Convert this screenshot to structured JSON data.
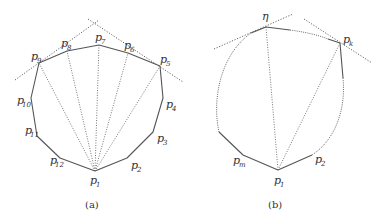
{
  "figure": {
    "panels": [
      {
        "id": "a",
        "caption": "(a)",
        "vertices": [
          {
            "name": "p",
            "sub": "1",
            "x": 95,
            "y": 171,
            "lx": 90,
            "ly": 184
          },
          {
            "name": "p",
            "sub": "2",
            "x": 127,
            "y": 158,
            "lx": 131,
            "ly": 169
          },
          {
            "name": "p",
            "sub": "3",
            "x": 153,
            "y": 132,
            "lx": 157,
            "ly": 142
          },
          {
            "name": "p",
            "sub": "4",
            "x": 163,
            "y": 98,
            "lx": 166,
            "ly": 108
          },
          {
            "name": "p",
            "sub": "5",
            "x": 160,
            "y": 66,
            "lx": 158,
            "ly": 63
          },
          {
            "name": "p",
            "sub": "6",
            "x": 128,
            "y": 53,
            "lx": 124,
            "ly": 49
          },
          {
            "name": "p",
            "sub": "7",
            "x": 99,
            "y": 45,
            "lx": 95,
            "ly": 41
          },
          {
            "name": "p",
            "sub": "8",
            "x": 67,
            "y": 51,
            "lx": 61,
            "ly": 47
          },
          {
            "name": "p",
            "sub": "9",
            "x": 39,
            "y": 63,
            "lx": 31,
            "ly": 60
          },
          {
            "name": "p",
            "sub": "10",
            "x": 31,
            "y": 98,
            "lx": 17,
            "ly": 104
          },
          {
            "name": "p",
            "sub": "11",
            "x": 37,
            "y": 136,
            "lx": 25,
            "ly": 134
          },
          {
            "name": "p",
            "sub": "12",
            "x": 60,
            "y": 158,
            "lx": 50,
            "ly": 164
          }
        ],
        "tangent_lines": [
          {
            "x1": 15,
            "y1": 80,
            "x2": 99,
            "y2": 20
          },
          {
            "x1": 88,
            "y1": 19,
            "x2": 183,
            "y2": 82
          }
        ]
      },
      {
        "id": "b",
        "caption": "(b)",
        "vertices": [
          {
            "name": "p",
            "sub": "1",
            "x": 278,
            "y": 170,
            "lx": 274,
            "ly": 184
          },
          {
            "name": "p",
            "sub": "2",
            "x": 312,
            "y": 155,
            "lx": 315,
            "ly": 163
          },
          {
            "name": "p",
            "sub": "m",
            "x": 243,
            "y": 155,
            "lx": 233,
            "ly": 164
          },
          {
            "name": "η",
            "sub": "",
            "x": 266,
            "y": 27,
            "lx": 262,
            "ly": 20
          },
          {
            "name": "p",
            "sub": "k",
            "x": 340,
            "y": 43,
            "lx": 343,
            "ly": 43
          }
        ],
        "tangent_lines": [
          {
            "x1": 214,
            "y1": 49,
            "x2": 293,
            "y2": 14
          },
          {
            "x1": 304,
            "y1": 19,
            "x2": 372,
            "y2": 63
          }
        ]
      }
    ]
  }
}
